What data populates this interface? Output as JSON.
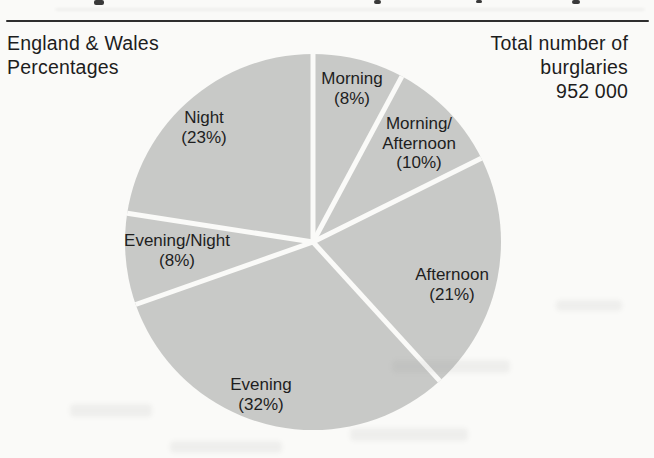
{
  "header": {
    "region_line1": "England & Wales",
    "region_line2": "Percentages",
    "total_line1": "Total number of",
    "total_line2": "burglaries",
    "total_line3": "952 000"
  },
  "chart_data": {
    "type": "pie",
    "region": "England & Wales",
    "unit": "percent",
    "total_burglaries_label": "952 000",
    "total_burglaries_value": 952000,
    "start_angle_deg": 0,
    "direction": "clockwise",
    "slices": [
      {
        "name": "Morning",
        "value": 8,
        "label_lines": [
          "Morning",
          "(8%)"
        ]
      },
      {
        "name": "Morning/Afternoon",
        "value": 10,
        "label_lines": [
          "Morning/",
          "Afternoon",
          "(10%)"
        ]
      },
      {
        "name": "Afternoon",
        "value": 21,
        "label_lines": [
          "Afternoon",
          "(21%)"
        ]
      },
      {
        "name": "Evening",
        "value": 32,
        "label_lines": [
          "Evening",
          "(32%)"
        ]
      },
      {
        "name": "Evening/Night",
        "value": 8,
        "label_lines": [
          "Evening/Night",
          "(8%)"
        ]
      },
      {
        "name": "Night",
        "value": 23,
        "label_lines": [
          "Night",
          "(23%)"
        ]
      }
    ],
    "colors": {
      "slice_fill": "#c8c9c7",
      "divider": "#fafaf8",
      "text": "#1e1e1e",
      "rule": "#2e2e2e",
      "background": "#fafaf8"
    }
  }
}
